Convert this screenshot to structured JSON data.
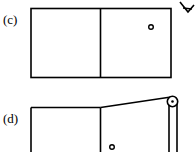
{
  "panels": [
    {
      "label": "(c)",
      "description": "Box divided into two halves, small circle in upper right of right half, viewer eye at top-right corner"
    },
    {
      "label": "(d)",
      "description": "Box divided into two halves with a cord from divider top over a pulley at top-right corner running down the right side, small circle at bottom of right half"
    }
  ],
  "colors": {
    "stroke": "#000000",
    "background": "#ffffff"
  },
  "icons": {
    "viewer": "eye-icon",
    "pulley": "pulley-icon",
    "particle": "circle-icon"
  }
}
